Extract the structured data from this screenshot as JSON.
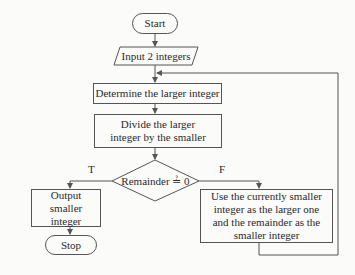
{
  "flowchart": {
    "start": "Start",
    "input": "Input 2 integers",
    "determine": "Determine the larger integer",
    "divide": "Divide the larger integer by the smaller",
    "decision": "Remainder ≟ 0",
    "true_label": "T",
    "false_label": "F",
    "output": "Output smaller integer",
    "stop": "Stop",
    "swap": "Use the currently smaller integer as the larger one and the remainder as the smaller integer"
  },
  "colors": {
    "line": "#555555",
    "background": "#fbfbfa",
    "text": "#2a2a2a"
  }
}
